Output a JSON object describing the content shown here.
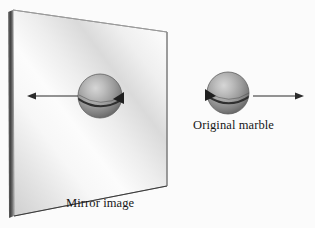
{
  "figure": {
    "title": "",
    "background_color": "#fbfbfb",
    "caption_font": "serif"
  },
  "labels": {
    "mirror_image": "Mirror image",
    "original_marble": "Original marble"
  },
  "colors": {
    "sphere_light": "#c9c9c9",
    "sphere_mid": "#9a9a9a",
    "sphere_dark": "#6e6e6e",
    "sphere_edge": "#5a5a5a",
    "mirror_bright": "#f6f6f6",
    "mirror_dim": "#d2d2d2",
    "mirror_frame": "#4a4a4a",
    "arrow": "#2b2b2b",
    "text": "#171717",
    "background": "#fbfbfb"
  },
  "diagram": {
    "type": "optics-mirror-reflection",
    "mirror_panel": {
      "name": "mirror-panel",
      "corners": [
        [
          13,
          10
        ],
        [
          167,
          32
        ],
        [
          167,
          186
        ],
        [
          14,
          216
        ]
      ],
      "frame_thickness_px": 6,
      "sheen": "diagonal-band"
    },
    "objects": [
      {
        "id": "mirror-marble",
        "name": "mirror-image-marble",
        "center": [
          100,
          96
        ],
        "radius": 22,
        "spin_arrow_direction": "arrowhead-right",
        "translation_arrow": {
          "direction": "left",
          "from_x": 78,
          "to_x": 28,
          "y": 96
        }
      },
      {
        "id": "original-marble",
        "name": "original-marble",
        "center": [
          228,
          93
        ],
        "radius": 21,
        "spin_arrow_direction": "arrowhead-left",
        "translation_arrow": {
          "direction": "right",
          "from_x": 253,
          "to_x": 303,
          "y": 96
        }
      }
    ]
  }
}
